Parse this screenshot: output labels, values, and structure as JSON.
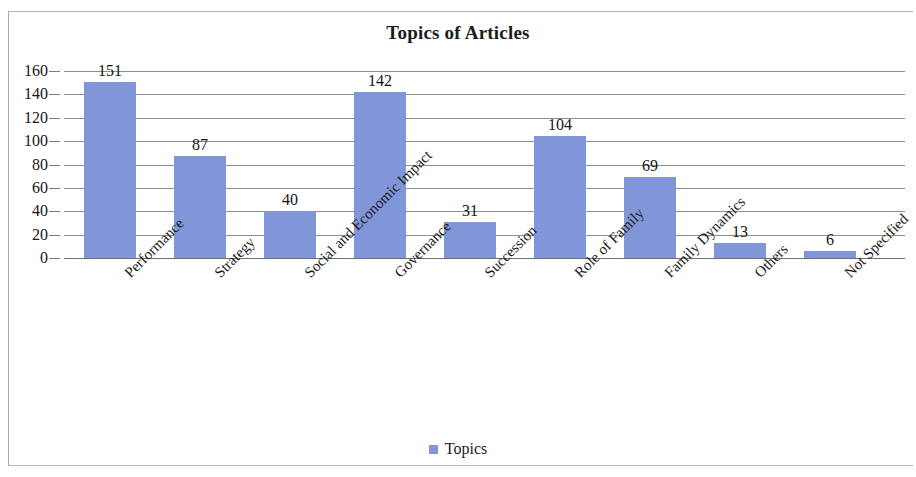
{
  "chart_data": {
    "type": "bar",
    "title": "Topics of Articles",
    "xlabel": "",
    "ylabel": "",
    "ylim": [
      0,
      160
    ],
    "ytick_step": 20,
    "yticks": [
      "0",
      "20",
      "40",
      "60",
      "80",
      "100",
      "120",
      "140",
      "160"
    ],
    "grid": true,
    "legend_position": "bottom",
    "categories": [
      "Performance",
      "Strategy",
      "Social and Economic Impact",
      "Governance",
      "Succession",
      "Role of Family",
      "Family Dynamics",
      "Others",
      "Not Specified"
    ],
    "values": [
      151,
      87,
      40,
      142,
      31,
      104,
      69,
      13,
      6
    ],
    "series": [
      {
        "name": "Topics",
        "color": "#8096d8",
        "values": [
          151,
          87,
          40,
          142,
          31,
          104,
          69,
          13,
          6
        ]
      }
    ],
    "data_labels": [
      "151",
      "87",
      "40",
      "142",
      "31",
      "104",
      "69",
      "13",
      "6"
    ]
  },
  "legend": {
    "entries": [
      {
        "label": "Topics",
        "color": "#8096d8"
      }
    ]
  },
  "colors": {
    "bar": "#8096d8",
    "gridline": "#8e8e8e",
    "axis": "#6f6f6f",
    "text": "#171717",
    "frame": "#a9a9a9",
    "background": "#ffffff"
  }
}
